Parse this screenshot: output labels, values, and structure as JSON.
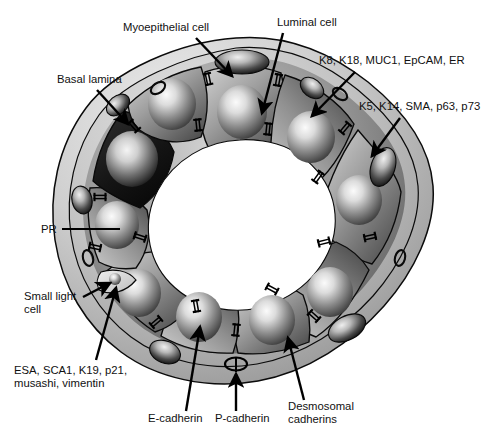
{
  "figure": {
    "type": "biological-schematic",
    "background_color": "#ffffff",
    "palette": {
      "basal_lamina_light": "#d9d9d9",
      "basal_lamina_mid": "#b5b5b5",
      "luminal_cell_light": "#d2d2d2",
      "luminal_cell_dark": "#4a4a4a",
      "pr_cell_dark": "#141414",
      "nucleus_highlight": "#f2f2f2",
      "lumen": "#ffffff",
      "outline": "#000000",
      "text": "#111111"
    }
  },
  "labels": {
    "myoepithelial_cell": "Myoepithelial cell",
    "luminal_cell": "Luminal cell",
    "basal_lamina": "Basal lamina",
    "luminal_markers": "K8, K18, MUC1, EpCAM, ER",
    "myoepithelial_markers": "K5, K14, SMA, p63, p73",
    "pr": "PR",
    "small_light_cell_line1": "Small light",
    "small_light_cell_line2": "cell",
    "progenitor_markers_line1": "ESA,  SCA1, K19, p21,",
    "progenitor_markers_line2": "musashi, vimentin",
    "e_cadherin": "E-cadherin",
    "p_cadherin": "P-cadherin",
    "desmosomal_cadherins_line1": "Desmosomal",
    "desmosomal_cadherins_line2": "cadherins"
  },
  "structures": {
    "lumen_label": "lumen",
    "luminal_cell_count": 10,
    "myoepithelial_nucleus_count": 7,
    "desmosome_symbol_count": 17,
    "p_cadherin_symbol": "oval ring junction",
    "small_light_cell": "small pale wedge cell with tiny nucleus at lower-left of epithelial ring",
    "pr_positive_cell": "single dark luminal cell on left side"
  }
}
